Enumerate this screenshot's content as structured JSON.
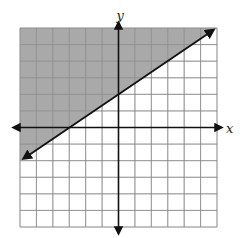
{
  "chart_data": {
    "type": "line",
    "title": "",
    "xlabel": "x",
    "ylabel": "y",
    "xlim": [
      -6,
      6
    ],
    "ylim": [
      -6,
      6
    ],
    "grid": true,
    "grid_step": 1,
    "tick_labels": false,
    "series": [
      {
        "name": "boundary",
        "equation": "y = (2/3)x + 2",
        "slope": 0.6667,
        "y_intercept": 2,
        "x_intercept": -3,
        "style": "solid",
        "arrows": "both",
        "x": [
          -6,
          -3,
          0,
          6
        ],
        "y": [
          -2,
          0,
          2,
          6
        ]
      }
    ],
    "shaded_region": {
      "inequality": "y >= (2/3)x + 2",
      "side": "above",
      "color": "#9a9a9a"
    }
  },
  "labels": {
    "x_axis": "x",
    "y_axis": "y"
  },
  "colors": {
    "grid": "#8a8a8a",
    "shade": "#9a9a9a",
    "axis": "#111111",
    "line": "#111111"
  }
}
